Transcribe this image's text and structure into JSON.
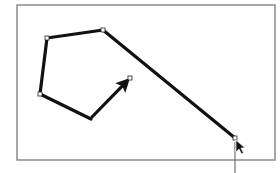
{
  "canvas": {
    "width": 280,
    "height": 173,
    "background": "#ffffff",
    "frame": {
      "x": 17,
      "y": 5,
      "width": 258,
      "height": 155,
      "stroke": "#8a8a8a"
    }
  },
  "polyline": {
    "stroke": "#111111",
    "stroke_width": 3.2,
    "points": [
      {
        "x": 91,
        "y": 119
      },
      {
        "x": 40,
        "y": 94
      },
      {
        "x": 47,
        "y": 38
      },
      {
        "x": 103,
        "y": 30
      },
      {
        "x": 235,
        "y": 138
      }
    ]
  },
  "arrow": {
    "from": {
      "x": 92,
      "y": 117
    },
    "to": {
      "x": 130,
      "y": 78
    },
    "stroke": "#111111"
  },
  "cursor": {
    "icon": "arrow-pointer-icon",
    "x": 236,
    "y": 140,
    "guide_line": {
      "x": 235,
      "y1": 142,
      "y2": 173
    }
  }
}
